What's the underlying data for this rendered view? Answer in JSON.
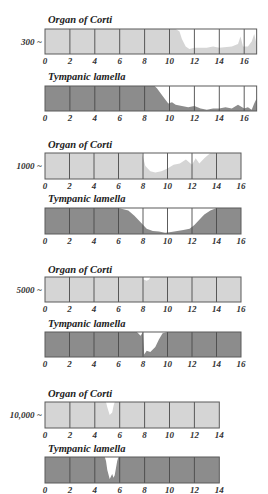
{
  "colors": {
    "background": "#ffffff",
    "corti_fill": "#d5d5d5",
    "tympanic_fill": "#8c8c8c",
    "border": "#5a5a5a",
    "gridline": "#4a4a4a"
  },
  "labels": {
    "corti": "Organ of Corti",
    "tympanic": "Tympanic lamella"
  },
  "chart_data": [
    {
      "type": "area",
      "frequency_label": "300 ~",
      "x_range": [
        0,
        17
      ],
      "ticks": [
        0,
        2,
        4,
        6,
        8,
        10,
        12,
        14,
        16
      ],
      "tick_labels": [
        "0",
        "2",
        "4",
        "6",
        "8",
        "10",
        "12",
        "14",
        "16"
      ],
      "xlabel": "",
      "ylabel": "",
      "series": [
        {
          "name": "Organ of Corti",
          "x": [
            0,
            10.5,
            10.8,
            11,
            11.3,
            11.6,
            12,
            13,
            13.5,
            14,
            15,
            15.5,
            15.7,
            15.9,
            16,
            16.3,
            16.6,
            16.8,
            17
          ],
          "values": [
            1,
            1,
            0.9,
            0.6,
            0.3,
            0.2,
            0.25,
            0.25,
            0.3,
            0.25,
            0.3,
            0.4,
            0.7,
            0.3,
            0.3,
            0.3,
            0.5,
            0.8,
            0.4
          ]
        },
        {
          "name": "Tympanic lamella",
          "x": [
            0,
            8.8,
            9,
            9.3,
            9.6,
            9.9,
            10.2,
            10.5,
            11,
            11.5,
            12,
            12.5,
            13,
            13.5,
            14,
            14.5,
            15,
            15.5,
            16,
            16.3,
            16.6,
            16.8,
            17
          ],
          "values": [
            1,
            1,
            0.9,
            0.7,
            0.5,
            0.3,
            0.35,
            0.25,
            0.2,
            0.15,
            0.2,
            0.1,
            0.05,
            0.1,
            0.1,
            0.15,
            0.1,
            0.25,
            0.1,
            0.15,
            0.05,
            0.3,
            0.5
          ]
        }
      ]
    },
    {
      "type": "area",
      "frequency_label": "1000 ~",
      "x_range": [
        0,
        16
      ],
      "ticks": [
        0,
        2,
        4,
        6,
        8,
        10,
        12,
        14,
        16
      ],
      "tick_labels": [
        "0",
        "2",
        "4",
        "6",
        "8",
        "10",
        "12",
        "14",
        "16"
      ],
      "xlabel": "",
      "ylabel": "",
      "series": [
        {
          "name": "Organ of Corti",
          "x": [
            0,
            7.9,
            8.2,
            8.6,
            9,
            9.5,
            10,
            10.5,
            11,
            11.5,
            12,
            12.3,
            12.6,
            13,
            13.5,
            14,
            16
          ],
          "values": [
            1,
            1,
            0.5,
            0.3,
            0.25,
            0.3,
            0.4,
            0.55,
            0.6,
            0.75,
            0.55,
            0.8,
            0.6,
            0.8,
            1,
            1,
            1
          ]
        },
        {
          "name": "Tympanic lamella",
          "x": [
            0,
            6,
            6.8,
            7.3,
            7.8,
            8.3,
            8.8,
            9.3,
            9.8,
            10.3,
            10.8,
            11.3,
            11.8,
            12.2,
            12.6,
            13,
            13.5,
            14,
            16
          ],
          "values": [
            1,
            1,
            0.9,
            0.7,
            0.45,
            0.2,
            0.12,
            0.1,
            0.05,
            0.08,
            0.12,
            0.15,
            0.2,
            0.35,
            0.55,
            0.75,
            0.9,
            1,
            1
          ]
        }
      ]
    },
    {
      "type": "area",
      "frequency_label": "5000 ~",
      "x_range": [
        0,
        16
      ],
      "ticks": [
        0,
        2,
        4,
        6,
        8,
        10,
        12,
        14,
        16
      ],
      "tick_labels": [
        "0",
        "2",
        "4",
        "6",
        "8",
        "10",
        "12",
        "14",
        "16"
      ],
      "xlabel": "",
      "ylabel": "",
      "series": [
        {
          "name": "Organ of Corti",
          "x": [
            0,
            7.95,
            8.05,
            8.3,
            8.5,
            8.6,
            16
          ],
          "values": [
            1,
            1,
            0.9,
            0.85,
            0.9,
            1,
            1
          ]
        },
        {
          "name": "Tympanic lamella",
          "x": [
            0,
            7.5,
            7.8,
            8,
            8.1,
            8.3,
            8.6,
            9,
            9.3,
            9.6,
            10,
            16
          ],
          "values": [
            1,
            1,
            0.85,
            1,
            0.1,
            0.25,
            0.2,
            0.4,
            0.7,
            0.95,
            1,
            1
          ]
        }
      ]
    },
    {
      "type": "area",
      "frequency_label": "10,000 ~",
      "x_range": [
        0,
        14
      ],
      "ticks": [
        0,
        2,
        4,
        6,
        8,
        10,
        12,
        14
      ],
      "tick_labels": [
        "0",
        "2",
        "4",
        "6",
        "8",
        "10",
        "12",
        "14"
      ],
      "xlabel": "",
      "ylabel": "",
      "series": [
        {
          "name": "Organ of Corti",
          "x": [
            0,
            4.9,
            5.0,
            5.2,
            5.4,
            5.5,
            5.6,
            14
          ],
          "values": [
            1,
            1,
            0.8,
            0.5,
            0.6,
            0.85,
            1,
            1
          ]
        },
        {
          "name": "Tympanic lamella",
          "x": [
            0,
            4.8,
            4.9,
            5.0,
            5.2,
            5.4,
            5.5,
            5.6,
            5.8,
            5.9,
            14
          ],
          "values": [
            1,
            1,
            0.85,
            0.5,
            0.15,
            0.35,
            0.2,
            0.3,
            0.85,
            1,
            1
          ]
        }
      ]
    }
  ]
}
